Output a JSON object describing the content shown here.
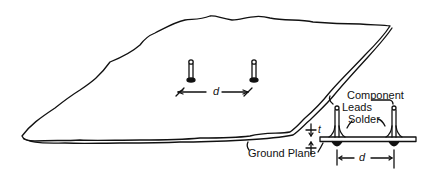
{
  "diagram": {
    "labels": {
      "component_leads_line1": "Component",
      "component_leads_line2": "Leads",
      "solder": "Solder",
      "ground_plane": "Ground Plane",
      "spacing_plane": "d",
      "spacing_detail": "d",
      "thickness": "t"
    },
    "colors": {
      "ink": "#111111",
      "background": "#ffffff"
    }
  }
}
